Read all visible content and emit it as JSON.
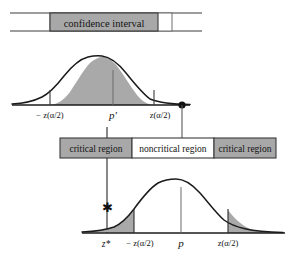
{
  "figure": {
    "type": "statistics-diagram",
    "colors": {
      "shade_fill": "#a9a9a9",
      "box_fill": "#a8a8a8",
      "box_white": "#ffffff",
      "stroke": "#1a1a1a",
      "text": "#111111"
    }
  },
  "ci_bar": {
    "label": "confidence interval",
    "bar_left_x": 10,
    "bar_right_x": 202,
    "box_left_x": 50,
    "box_right_x": 158,
    "y": 22
  },
  "top_curve": {
    "name": "sampling-distribution-of-p-prime",
    "shaded_region": "center",
    "axis_labels": [
      {
        "id": "left-crit",
        "text": "− z(α/2)",
        "x": 50,
        "align": "center"
      },
      {
        "id": "center",
        "text": "p′",
        "x": 113,
        "align": "center"
      },
      {
        "id": "right-crit",
        "text": "z(α/2)",
        "x": 160,
        "align": "center"
      }
    ],
    "marker": {
      "name": "observed-point-dot",
      "x": 182,
      "y": 105
    },
    "baseline_y": 105,
    "peak_y": 57,
    "x_start": 12,
    "x_end": 190
  },
  "region_bar": {
    "boxes": [
      {
        "id": "critical-left",
        "label": "critical region",
        "fill": "gray"
      },
      {
        "id": "noncritical",
        "label": "noncritical region",
        "fill": "white"
      },
      {
        "id": "critical-right",
        "label": "critical region",
        "fill": "gray"
      }
    ],
    "left_x": 60,
    "right_x": 276,
    "top_y": 138,
    "height": 20
  },
  "bottom_curve": {
    "name": "null-distribution-of-p",
    "shaded_region": "tails",
    "axis_labels": [
      {
        "id": "z-star",
        "text": "z*",
        "x": 106,
        "align": "center"
      },
      {
        "id": "left-crit",
        "text": "− z(α/2)",
        "x": 138,
        "align": "center"
      },
      {
        "id": "center",
        "text": "p",
        "x": 181,
        "align": "center"
      },
      {
        "id": "right-crit",
        "text": "z(α/2)",
        "x": 228,
        "align": "center"
      }
    ],
    "marker": {
      "name": "z-star-asterisk",
      "x": 107,
      "y": 208
    },
    "baseline_y": 233,
    "peak_y": 180,
    "x_start": 82,
    "x_end": 283
  },
  "connectors": [
    {
      "id": "dot-to-critical-right",
      "from_x": 182,
      "from_y": 105,
      "to_x": 182,
      "to_y": 138
    },
    {
      "id": "critical-left-to-zstar",
      "from_x": 107,
      "from_y": 158,
      "to_x": 107,
      "to_y": 233
    }
  ]
}
